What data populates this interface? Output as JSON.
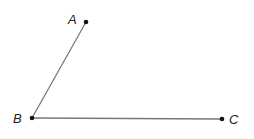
{
  "diagram": {
    "points": [
      {
        "label": "A",
        "x": 86,
        "y": 22,
        "lx": 68,
        "ly": 24
      },
      {
        "label": "B",
        "x": 32,
        "y": 118,
        "lx": 13,
        "ly": 123
      },
      {
        "label": "C",
        "x": 222,
        "y": 119,
        "lx": 229,
        "ly": 124
      }
    ],
    "segments": [
      [
        "B",
        "A"
      ],
      [
        "B",
        "C"
      ]
    ],
    "line_color": "#777777",
    "point_color": "#111111"
  }
}
